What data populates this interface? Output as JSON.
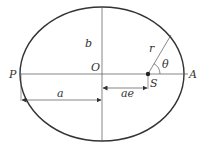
{
  "diagram": {
    "colors": {
      "stroke": "#333333",
      "thin": "#555555",
      "background": "#ffffff"
    },
    "ellipse": {
      "cx": 102,
      "cy": 74,
      "rx": 82,
      "ry": 67
    },
    "labels": {
      "P": "P",
      "A": "A",
      "O": "O",
      "S": "S",
      "b": "b",
      "r": "r",
      "theta": "θ",
      "a": "a",
      "ae": "ae"
    }
  }
}
